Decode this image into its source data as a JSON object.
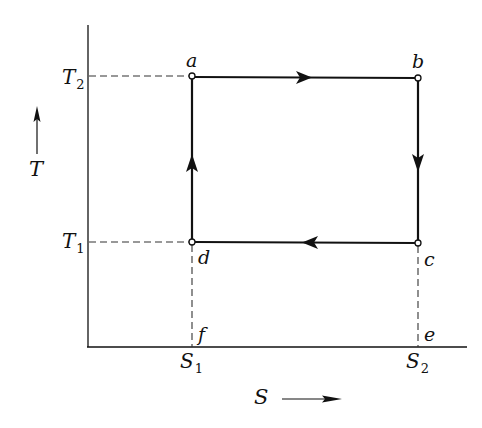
{
  "diagram": {
    "type": "Carnot cycle T-S diagram",
    "axes": {
      "x": {
        "label": "S",
        "direction_arrow": "right-arrow"
      },
      "y": {
        "label": "T",
        "direction_arrow": "up-arrow"
      }
    },
    "levels": {
      "T2": {
        "base": "T",
        "sub": "2"
      },
      "T1": {
        "base": "T",
        "sub": "1"
      },
      "S1": {
        "base": "S",
        "sub": "1"
      },
      "S2": {
        "base": "S",
        "sub": "2"
      }
    },
    "points": {
      "a": "a",
      "b": "b",
      "c": "c",
      "d": "d",
      "e": "e",
      "f": "f"
    },
    "cycle": [
      {
        "from": "a",
        "to": "b",
        "arrow": "right"
      },
      {
        "from": "b",
        "to": "c",
        "arrow": "down"
      },
      {
        "from": "c",
        "to": "d",
        "arrow": "left"
      },
      {
        "from": "d",
        "to": "a",
        "arrow": "up"
      }
    ],
    "colors": {
      "line": "#111111",
      "background": "#ffffff",
      "dashed": "#333333"
    }
  }
}
